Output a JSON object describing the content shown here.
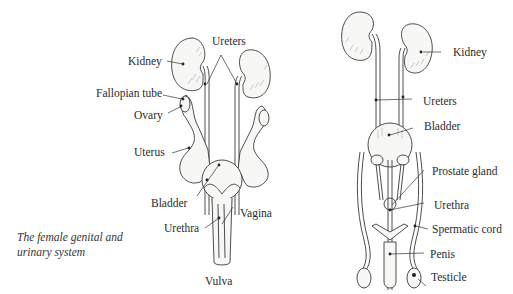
{
  "female": {
    "caption_line1": "The female genital and",
    "caption_line2": "urinary system",
    "labels": {
      "kidney": "Kidney",
      "ureters": "Ureters",
      "fallopian_tube": "Fallopian tube",
      "ovary": "Ovary",
      "uterus": "Uterus",
      "bladder": "Bladder",
      "urethra": "Urethra",
      "vagina": "Vagina",
      "vulva": "Vulva"
    }
  },
  "male": {
    "labels": {
      "kidney": "Kidney",
      "ureters": "Ureters",
      "bladder": "Bladder",
      "prostate_gland": "Prostate gland",
      "urethra": "Urethra",
      "spermatic_cord": "Spermatic cord",
      "penis": "Penis",
      "testicle": "Testicle"
    }
  }
}
